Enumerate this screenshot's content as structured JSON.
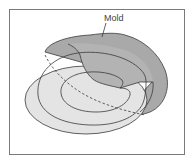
{
  "figure": {
    "labels": {
      "mold": "Mold"
    },
    "colors": {
      "frame": "#7a7a7a",
      "mold_fill": "#a9a9a9",
      "mold_inner_fill": "#b8b8b8",
      "ring_fill": "#e2e2e2",
      "ring_fill_light": "#ececec",
      "stroke": "#3a3a3a"
    }
  }
}
